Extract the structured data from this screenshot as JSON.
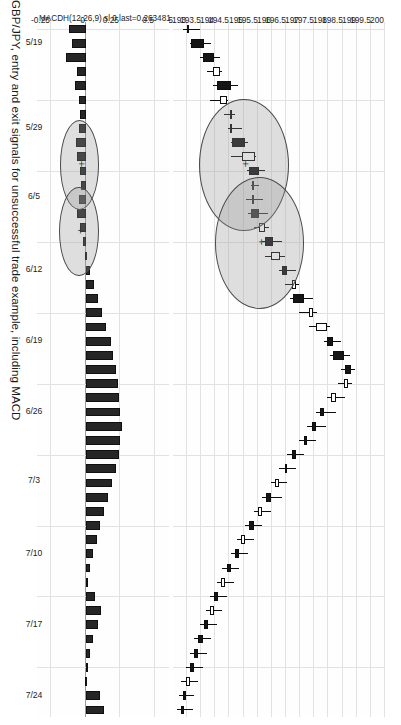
{
  "figure": {
    "caption": "GBP/JPY, entry and exit signals for unsuccessful trade example, including MACD",
    "background": "#ffffff",
    "grid_color": "#e2e2e2",
    "candle_color": "#151515",
    "annotation_fill": "#969696"
  },
  "price_axis": {
    "label": "",
    "ticks": [
      "200",
      "199.5",
      "199",
      "198.5",
      "198",
      "197.5",
      "197",
      "196.5",
      "196",
      "195.5",
      "195",
      "194.5",
      "194",
      "193.5",
      "193",
      "192.5"
    ],
    "min": 192.5,
    "max": 200.0
  },
  "macd_axis": {
    "legend": "MACDH(12,26,9) sl 0 last=0.263481",
    "ticks": [
      "0.5",
      "0.25",
      "0",
      "-0.25"
    ],
    "min": -0.35,
    "max": 0.6
  },
  "date_axis": {
    "ticks": [
      "5/19",
      "5/29",
      "6/5",
      "6/12",
      "6/19",
      "6/26",
      "7/3",
      "7/10",
      "7/17",
      "7/24"
    ]
  },
  "chart_data": {
    "type": "candlestick",
    "title": "GBP/JPY, entry and exit signals for unsuccessful trade example, including MACD",
    "xlabel": "",
    "ylabel": "Price",
    "ylim": [
      192.5,
      200.0
    ],
    "grid": true,
    "legend": "MACDH(12,26,9) sl 0 last=0.263481",
    "x": [
      "5/19",
      "5/20",
      "5/21",
      "5/22",
      "5/23",
      "5/26",
      "5/27",
      "5/28",
      "5/29",
      "5/30",
      "6/2",
      "6/3",
      "6/4",
      "6/5",
      "6/6",
      "6/9",
      "6/10",
      "6/11",
      "6/12",
      "6/13",
      "6/16",
      "6/17",
      "6/18",
      "6/19",
      "6/20",
      "6/23",
      "6/24",
      "6/25",
      "6/26",
      "6/27",
      "6/30",
      "7/1",
      "7/2",
      "7/3",
      "7/4",
      "7/7",
      "7/8",
      "7/9",
      "7/10",
      "7/11",
      "7/14",
      "7/15",
      "7/16",
      "7/17",
      "7/18",
      "7/21",
      "7/22",
      "7/23",
      "7/24"
    ],
    "ohlc": [
      {
        "o": 193.05,
        "h": 193.45,
        "l": 192.85,
        "c": 193.05,
        "dir": "down"
      },
      {
        "o": 193.6,
        "h": 193.85,
        "l": 193.1,
        "c": 193.15,
        "dir": "down"
      },
      {
        "o": 193.95,
        "h": 194.15,
        "l": 193.45,
        "c": 193.55,
        "dir": "down"
      },
      {
        "o": 193.9,
        "h": 194.25,
        "l": 193.7,
        "c": 194.15,
        "dir": "up"
      },
      {
        "o": 194.55,
        "h": 194.8,
        "l": 193.9,
        "c": 194.05,
        "dir": "down"
      },
      {
        "o": 194.15,
        "h": 194.45,
        "l": 193.8,
        "c": 194.4,
        "dir": "up"
      },
      {
        "o": 194.6,
        "h": 194.7,
        "l": 194.3,
        "c": 194.55,
        "dir": "up"
      },
      {
        "o": 194.6,
        "h": 194.95,
        "l": 194.45,
        "c": 194.55,
        "dir": "up"
      },
      {
        "o": 195.05,
        "h": 195.15,
        "l": 194.55,
        "c": 194.6,
        "dir": "down"
      },
      {
        "o": 194.95,
        "h": 195.45,
        "l": 194.55,
        "c": 195.4,
        "dir": "up"
      },
      {
        "o": 195.55,
        "h": 195.75,
        "l": 195.1,
        "c": 195.2,
        "dir": "down"
      },
      {
        "o": 195.35,
        "h": 195.55,
        "l": 195.25,
        "c": 195.3,
        "dir": "down"
      },
      {
        "o": 195.3,
        "h": 195.7,
        "l": 195.1,
        "c": 195.35,
        "dir": "down"
      },
      {
        "o": 195.55,
        "h": 195.85,
        "l": 195.15,
        "c": 195.25,
        "dir": "down"
      },
      {
        "o": 195.55,
        "h": 195.9,
        "l": 195.35,
        "c": 195.75,
        "dir": "up"
      },
      {
        "o": 196.05,
        "h": 196.35,
        "l": 195.65,
        "c": 195.75,
        "dir": "down"
      },
      {
        "o": 195.95,
        "h": 196.45,
        "l": 195.75,
        "c": 196.3,
        "dir": "up"
      },
      {
        "o": 196.55,
        "h": 196.85,
        "l": 196.25,
        "c": 196.35,
        "dir": "down"
      },
      {
        "o": 196.7,
        "h": 196.95,
        "l": 196.45,
        "c": 196.85,
        "dir": "up"
      },
      {
        "o": 197.15,
        "h": 197.45,
        "l": 196.65,
        "c": 196.75,
        "dir": "down"
      },
      {
        "o": 197.3,
        "h": 197.6,
        "l": 196.95,
        "c": 197.45,
        "dir": "up"
      },
      {
        "o": 197.55,
        "h": 198.05,
        "l": 197.3,
        "c": 197.95,
        "dir": "up"
      },
      {
        "o": 198.15,
        "h": 198.45,
        "l": 197.85,
        "c": 197.95,
        "dir": "down"
      },
      {
        "o": 198.55,
        "h": 198.75,
        "l": 198.05,
        "c": 198.15,
        "dir": "down"
      },
      {
        "o": 198.8,
        "h": 198.95,
        "l": 198.45,
        "c": 198.6,
        "dir": "down"
      },
      {
        "o": 198.55,
        "h": 198.85,
        "l": 198.35,
        "c": 198.7,
        "dir": "up"
      },
      {
        "o": 198.25,
        "h": 198.6,
        "l": 197.95,
        "c": 198.1,
        "dir": "up"
      },
      {
        "o": 197.85,
        "h": 198.25,
        "l": 197.55,
        "c": 197.7,
        "dir": "down"
      },
      {
        "o": 197.55,
        "h": 197.9,
        "l": 197.25,
        "c": 197.4,
        "dir": "down"
      },
      {
        "o": 197.25,
        "h": 197.55,
        "l": 196.95,
        "c": 197.15,
        "dir": "down"
      },
      {
        "o": 196.85,
        "h": 197.15,
        "l": 196.55,
        "c": 196.7,
        "dir": "down"
      },
      {
        "o": 196.55,
        "h": 196.85,
        "l": 196.25,
        "c": 196.45,
        "dir": "up"
      },
      {
        "o": 196.25,
        "h": 196.55,
        "l": 195.95,
        "c": 196.1,
        "dir": "up"
      },
      {
        "o": 195.95,
        "h": 196.35,
        "l": 195.65,
        "c": 195.8,
        "dir": "down"
      },
      {
        "o": 195.65,
        "h": 195.95,
        "l": 195.35,
        "c": 195.5,
        "dir": "up"
      },
      {
        "o": 195.35,
        "h": 195.65,
        "l": 195.05,
        "c": 195.2,
        "dir": "down"
      },
      {
        "o": 195.05,
        "h": 195.35,
        "l": 194.75,
        "c": 194.9,
        "dir": "up"
      },
      {
        "o": 194.85,
        "h": 195.15,
        "l": 194.55,
        "c": 194.7,
        "dir": "down"
      },
      {
        "o": 194.55,
        "h": 194.85,
        "l": 194.25,
        "c": 194.4,
        "dir": "down"
      },
      {
        "o": 194.35,
        "h": 194.65,
        "l": 194.05,
        "c": 194.2,
        "dir": "up"
      },
      {
        "o": 194.1,
        "h": 194.4,
        "l": 193.8,
        "c": 193.95,
        "dir": "down"
      },
      {
        "o": 193.95,
        "h": 194.25,
        "l": 193.65,
        "c": 193.8,
        "dir": "up"
      },
      {
        "o": 193.75,
        "h": 194.05,
        "l": 193.45,
        "c": 193.6,
        "dir": "down"
      },
      {
        "o": 193.55,
        "h": 193.85,
        "l": 193.25,
        "c": 193.4,
        "dir": "down"
      },
      {
        "o": 193.4,
        "h": 193.7,
        "l": 193.1,
        "c": 193.25,
        "dir": "down"
      },
      {
        "o": 193.25,
        "h": 193.55,
        "l": 192.95,
        "c": 193.1,
        "dir": "down"
      },
      {
        "o": 193.1,
        "h": 193.4,
        "l": 192.8,
        "c": 192.95,
        "dir": "up"
      },
      {
        "o": 192.95,
        "h": 193.25,
        "l": 192.7,
        "c": 192.85,
        "dir": "down"
      },
      {
        "o": 192.9,
        "h": 193.2,
        "l": 192.65,
        "c": 192.8,
        "dir": "down"
      }
    ],
    "macd_histogram": [
      -0.12,
      -0.1,
      -0.14,
      -0.06,
      -0.08,
      -0.05,
      -0.04,
      -0.05,
      -0.07,
      -0.06,
      -0.04,
      -0.03,
      -0.05,
      -0.06,
      -0.04,
      -0.02,
      0.01,
      0.03,
      0.06,
      0.09,
      0.12,
      0.15,
      0.18,
      0.2,
      0.22,
      0.23,
      0.24,
      0.25,
      0.26,
      0.25,
      0.24,
      0.22,
      0.19,
      0.16,
      0.13,
      0.1,
      0.08,
      0.05,
      0.03,
      0.02,
      0.07,
      0.11,
      0.09,
      0.05,
      0.03,
      0.02,
      0.01,
      0.1,
      0.13
    ],
    "annotations": [
      {
        "name": "entry-signal-ellipse",
        "panel": "price",
        "center_index": 9.5,
        "center_value": 195.05,
        "rx_index": 4.6,
        "ry_value": 1.55
      },
      {
        "name": "exit-signal-ellipse",
        "panel": "price",
        "center_index": 15.0,
        "center_value": 195.6,
        "rx_index": 4.6,
        "ry_value": 1.55
      },
      {
        "name": "entry-signal-ellipse-macd",
        "panel": "macd",
        "center_index": 9.5,
        "center_value": -0.035,
        "rx_index": 3.1,
        "ry_value": 0.135
      },
      {
        "name": "exit-signal-ellipse-macd",
        "panel": "macd",
        "center_index": 14.2,
        "center_value": -0.04,
        "rx_index": 3.1,
        "ry_value": 0.135
      }
    ]
  }
}
